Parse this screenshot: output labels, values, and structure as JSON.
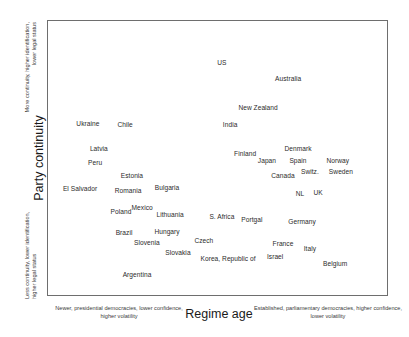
{
  "chart_data": {
    "type": "scatter",
    "title": "",
    "xlabel": "Regime age",
    "ylabel": "Party continuity",
    "xlim": [
      0,
      100
    ],
    "ylim": [
      0,
      100
    ],
    "grid": false,
    "legend": "none",
    "axis_notes": {
      "y_high": "More continuity, higher identification, lower legal status",
      "y_low": "Less continuity, lower identification, higher legal status",
      "x_low": "Newer, presidential democracies, lower confidence, higher volatility",
      "x_high": "Established, parliamentary democracies, higher confidence, lower volatility"
    },
    "points": [
      {
        "label": "US",
        "x": 51.3,
        "y": 84.8
      },
      {
        "label": "Australia",
        "x": 70.7,
        "y": 79.0
      },
      {
        "label": "New Zealand",
        "x": 61.9,
        "y": 68.5
      },
      {
        "label": "India",
        "x": 53.7,
        "y": 62.3
      },
      {
        "label": "Ukraine",
        "x": 12.0,
        "y": 62.7
      },
      {
        "label": "Chile",
        "x": 22.9,
        "y": 62.3
      },
      {
        "label": "Latvia",
        "x": 15.2,
        "y": 53.6
      },
      {
        "label": "Peru",
        "x": 14.1,
        "y": 48.6
      },
      {
        "label": "Denmark",
        "x": 73.6,
        "y": 53.6
      },
      {
        "label": "Finland",
        "x": 58.1,
        "y": 51.8
      },
      {
        "label": "Japan",
        "x": 64.5,
        "y": 49.3
      },
      {
        "label": "Spain",
        "x": 73.6,
        "y": 49.3
      },
      {
        "label": "Norway",
        "x": 85.3,
        "y": 49.3
      },
      {
        "label": "Switz.",
        "x": 77.1,
        "y": 45.3
      },
      {
        "label": "Sweden",
        "x": 86.2,
        "y": 45.3
      },
      {
        "label": "Estonia",
        "x": 24.9,
        "y": 43.8
      },
      {
        "label": "Bulgaria",
        "x": 35.2,
        "y": 39.5
      },
      {
        "label": "Romania",
        "x": 23.8,
        "y": 38.4
      },
      {
        "label": "El Salvador",
        "x": 9.7,
        "y": 39.1
      },
      {
        "label": "Canada",
        "x": 69.2,
        "y": 43.8
      },
      {
        "label": "NL",
        "x": 74.2,
        "y": 37.3
      },
      {
        "label": "UK",
        "x": 79.5,
        "y": 37.7
      },
      {
        "label": "Mexico",
        "x": 27.9,
        "y": 32.2
      },
      {
        "label": "Poland",
        "x": 21.7,
        "y": 30.8
      },
      {
        "label": "Lithuania",
        "x": 36.1,
        "y": 29.7
      },
      {
        "label": "S. Africa",
        "x": 51.3,
        "y": 29.0
      },
      {
        "label": "Portgal",
        "x": 60.1,
        "y": 27.9
      },
      {
        "label": "Germany",
        "x": 74.8,
        "y": 27.2
      },
      {
        "label": "Brazil",
        "x": 22.6,
        "y": 23.2
      },
      {
        "label": "Hungary",
        "x": 35.2,
        "y": 23.6
      },
      {
        "label": "Slovenia",
        "x": 29.3,
        "y": 19.6
      },
      {
        "label": "Czech",
        "x": 46.0,
        "y": 20.3
      },
      {
        "label": "France",
        "x": 69.2,
        "y": 19.2
      },
      {
        "label": "Italy",
        "x": 77.1,
        "y": 17.4
      },
      {
        "label": "Slovakia",
        "x": 38.4,
        "y": 15.9
      },
      {
        "label": "Israel",
        "x": 66.9,
        "y": 14.5
      },
      {
        "label": "Korea, Republic of",
        "x": 53.1,
        "y": 13.8
      },
      {
        "label": "Belgium",
        "x": 84.5,
        "y": 12.0
      },
      {
        "label": "Argentina",
        "x": 26.4,
        "y": 8.0
      }
    ]
  }
}
